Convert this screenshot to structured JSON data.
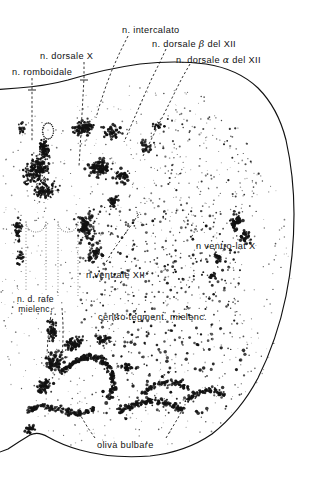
{
  "figure": {
    "kind": "histological-cross-section",
    "region": "medulla oblongata (bulbo) — transverse section",
    "language": "it",
    "ink_color": "#111111",
    "paper_color": "#ffffff"
  },
  "labels": {
    "intercalato": {
      "text": "n. intercalato",
      "x": 122,
      "y": 26
    },
    "dorsale_beta": {
      "pre": "n. dorsale ",
      "greek": "β",
      "post": " del XII",
      "x": 152,
      "y": 39
    },
    "dorsale_alpha": {
      "pre": "n. dorsale ",
      "greek": "α",
      "post": " del XII",
      "x": 176,
      "y": 55
    },
    "dorsale_x": {
      "text": "n. dorsale X",
      "x": 40,
      "y": 52
    },
    "romboidale": {
      "text": "n. romboidale",
      "x": 12,
      "y": 68
    },
    "ventro_lat_x": {
      "text": "n  ventro-lat X",
      "x": 196,
      "y": 242
    },
    "ventrale_xii": {
      "text": "n  ventrale  XII",
      "x": 86,
      "y": 271
    },
    "rafe": {
      "line1": "n.  d.  rafe",
      "line2": "mielenc.",
      "x": 17,
      "y": 295
    },
    "centro_tegm": {
      "text": "centro  tegment.  mielenc.",
      "x": 98,
      "y": 313
    },
    "oliva": {
      "text": "oliva  bulbare",
      "x": 97,
      "y": 441
    }
  },
  "outline": {
    "name": "section-contour",
    "path": "M -8 90 L 18 88 Q 46 86 68 80 Q 104 69 140 64 Q 176 60 206 64 Q 238 69 258 88 Q 278 108 286 140 Q 294 176 294 214 Q 294 256 286 296 Q 277 340 258 378 Q 240 412 212 434 Q 186 452 150 456 Q 112 459 80 450 Q 62 445 48 437 Q 38 431 30 435 Q 20 441 8 449 L -8 455"
  },
  "leaders": [
    {
      "name": "leader-intercalato",
      "path": "M 128 36 L 120 52 L 112 70 L 106 86 L 100 104 L 96 118"
    },
    {
      "name": "leader-dorsale-beta",
      "path": "M 166 49 L 160 62 L 152 78 L 144 96 L 137 112 L 130 128 L 124 142"
    },
    {
      "name": "leader-dorsale-alpha",
      "path": "M 190 64 L 182 78 L 174 94 L 166 110 L 158 126 L 150 142 L 143 156"
    },
    {
      "name": "leader-dorsale-x",
      "path": "M 84 62 L 84 78 L 83 96 L 82 114 L 81 132 L 80 150 L 79 166"
    },
    {
      "name": "leader-romboidale",
      "path": "M 32 78 L 32 94 L 32 110 L 32 126 L 32 142"
    },
    {
      "name": "leader-ventrale-xii",
      "path": "M 104 266 L 112 252 L 122 238 L 132 224 L 140 212"
    },
    {
      "name": "leader-ventro-lat-x",
      "path": "M 214 248 L 216 258 L 218 268"
    },
    {
      "name": "leader-rafe-a",
      "path": "M 52 308 L 50 322 L 48 338 L 47 354"
    },
    {
      "name": "leader-rafe-b",
      "path": "M 62 308 L 63 324 L 63 340 L 62 356"
    },
    {
      "name": "leader-oliva-left",
      "path": "M 95 438 L 88 428 L 82 418 L 78 410"
    },
    {
      "name": "leader-oliva-right",
      "path": "M 166 438 L 172 428 L 178 418 L 182 410"
    }
  ],
  "stipple": {
    "note": "dot fields representing neuron cell bodies",
    "fields": [
      {
        "name": "raphe-column",
        "count": 300
      },
      {
        "name": "hypoglossal-column",
        "count": 150
      },
      {
        "name": "dorsal-vagal-field",
        "count": 220
      },
      {
        "name": "reticular-field",
        "count": 420
      },
      {
        "name": "ventro-lateral-vagus",
        "count": 70
      },
      {
        "name": "inferior-olive-band",
        "count": 420
      },
      {
        "name": "fine-background",
        "count": 900
      }
    ]
  }
}
